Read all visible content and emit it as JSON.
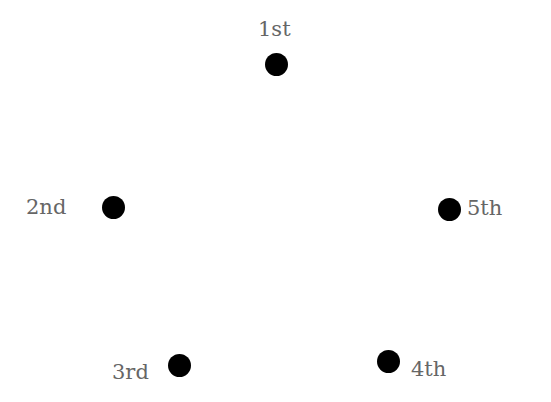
{
  "diagram": {
    "dot_color": "#000000",
    "label_color": "#666666",
    "points": [
      {
        "label": "1st",
        "cx": 276,
        "cy": 64,
        "lx": 258,
        "ly": 19
      },
      {
        "label": "2nd",
        "cx": 113,
        "cy": 207,
        "lx": 26,
        "ly": 197
      },
      {
        "label": "3rd",
        "cx": 179,
        "cy": 365,
        "lx": 112,
        "ly": 362
      },
      {
        "label": "4th",
        "cx": 388,
        "cy": 361,
        "lx": 411,
        "ly": 359
      },
      {
        "label": "5th",
        "cx": 449,
        "cy": 209,
        "lx": 467,
        "ly": 198
      }
    ]
  }
}
